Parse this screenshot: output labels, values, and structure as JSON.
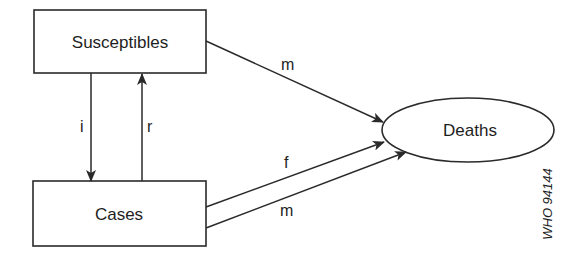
{
  "diagram": {
    "type": "flow",
    "nodes": [
      {
        "id": "susceptibles",
        "label": "Susceptibles",
        "shape": "rectangle"
      },
      {
        "id": "cases",
        "label": "Cases",
        "shape": "rectangle"
      },
      {
        "id": "deaths",
        "label": "Deaths",
        "shape": "ellipse"
      }
    ],
    "edges": [
      {
        "from": "susceptibles",
        "to": "cases",
        "label": "i"
      },
      {
        "from": "cases",
        "to": "susceptibles",
        "label": "r"
      },
      {
        "from": "susceptibles",
        "to": "deaths",
        "label": "m"
      },
      {
        "from": "cases",
        "to": "deaths",
        "label": "f"
      },
      {
        "from": "cases",
        "to": "deaths",
        "label": "m"
      }
    ],
    "reference_code": "WHO 94144"
  }
}
